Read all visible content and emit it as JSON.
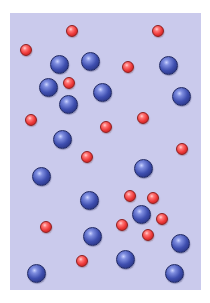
{
  "diagram": {
    "panel": {
      "x": 10,
      "y": 13,
      "width": 191,
      "height": 277,
      "color": "#cacaec"
    },
    "colors": {
      "blue": "#3f4fb0",
      "red": "#ee3a3a",
      "background": "#cacaec"
    },
    "counts": {
      "blue": 18,
      "red": 19
    },
    "particles": [
      {
        "type": "red",
        "x": 72,
        "y": 31
      },
      {
        "type": "red",
        "x": 158,
        "y": 31
      },
      {
        "type": "red",
        "x": 26,
        "y": 50
      },
      {
        "type": "blue",
        "x": 59,
        "y": 64
      },
      {
        "type": "blue",
        "x": 90,
        "y": 61
      },
      {
        "type": "red",
        "x": 128,
        "y": 67
      },
      {
        "type": "blue",
        "x": 168,
        "y": 65
      },
      {
        "type": "blue",
        "x": 48,
        "y": 87
      },
      {
        "type": "red",
        "x": 69,
        "y": 83
      },
      {
        "type": "blue",
        "x": 102,
        "y": 92
      },
      {
        "type": "blue",
        "x": 181,
        "y": 96
      },
      {
        "type": "blue",
        "x": 68,
        "y": 104
      },
      {
        "type": "red",
        "x": 31,
        "y": 120
      },
      {
        "type": "red",
        "x": 106,
        "y": 127
      },
      {
        "type": "red",
        "x": 143,
        "y": 118
      },
      {
        "type": "blue",
        "x": 62,
        "y": 139
      },
      {
        "type": "red",
        "x": 87,
        "y": 157
      },
      {
        "type": "red",
        "x": 182,
        "y": 149
      },
      {
        "type": "blue",
        "x": 143,
        "y": 168
      },
      {
        "type": "blue",
        "x": 41,
        "y": 176
      },
      {
        "type": "blue",
        "x": 89,
        "y": 200
      },
      {
        "type": "red",
        "x": 130,
        "y": 196
      },
      {
        "type": "red",
        "x": 153,
        "y": 198
      },
      {
        "type": "blue",
        "x": 141,
        "y": 214
      },
      {
        "type": "red",
        "x": 122,
        "y": 225
      },
      {
        "type": "red",
        "x": 162,
        "y": 219
      },
      {
        "type": "red",
        "x": 46,
        "y": 227
      },
      {
        "type": "red",
        "x": 148,
        "y": 235
      },
      {
        "type": "blue",
        "x": 92,
        "y": 236
      },
      {
        "type": "blue",
        "x": 180,
        "y": 243
      },
      {
        "type": "red",
        "x": 82,
        "y": 261
      },
      {
        "type": "blue",
        "x": 125,
        "y": 259
      },
      {
        "type": "blue",
        "x": 36,
        "y": 273
      },
      {
        "type": "blue",
        "x": 174,
        "y": 273
      }
    ]
  }
}
